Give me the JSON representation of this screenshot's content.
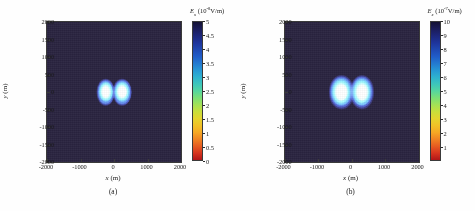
{
  "figure": {
    "panels": [
      {
        "caption": "(a)",
        "xlabel_sym": "x",
        "xlabel_unit": "(m)",
        "ylabel_sym": "y",
        "ylabel_unit": "(m)",
        "colorbar_sym": "E",
        "colorbar_sub": "x",
        "colorbar_unit": "(10",
        "colorbar_exp": "-8",
        "colorbar_unit2": "V/m)"
      },
      {
        "caption": "(b)",
        "xlabel_sym": "x",
        "xlabel_unit": "(m)",
        "ylabel_sym": "y",
        "ylabel_unit": "(m)",
        "colorbar_sym": "E",
        "colorbar_sub": "x",
        "colorbar_unit": "(10",
        "colorbar_exp": "-7",
        "colorbar_unit2": "V/m)"
      }
    ]
  },
  "chart_data": [
    {
      "type": "heatmap",
      "title": "",
      "panel": "(a)",
      "xlabel": "x (m)",
      "ylabel": "y (m)",
      "xlim": [
        -2000,
        2000
      ],
      "ylim": [
        -2000,
        2000
      ],
      "xticks": [
        -2000,
        -1000,
        0,
        1000,
        2000
      ],
      "xticklabels": [
        "-2000",
        "-1000",
        "0",
        "1000",
        "2000"
      ],
      "yticks": [
        2000,
        1500,
        1000,
        500,
        0,
        -500,
        -1000,
        -1500,
        -2000
      ],
      "yticklabels": [
        "2000",
        "1500",
        "1000",
        "500",
        "0",
        "-500",
        "-1000",
        "-1500",
        "-2000"
      ],
      "grid": false,
      "colormap": "jet",
      "colorbar": {
        "label": "E_x (10^-8 V/m)",
        "min": 0,
        "max": 5,
        "ticks": [
          5,
          4.5,
          4,
          3.5,
          3,
          2.5,
          2,
          1.5,
          1,
          0.5,
          0
        ],
        "ticklabels": [
          "5",
          "4.5",
          "4",
          "3.5",
          "3",
          "2.5",
          "2",
          "1.5",
          "1",
          "0.5",
          "0"
        ]
      },
      "features": [
        {
          "name": "left-lobe",
          "center_x": -250,
          "center_y": 0,
          "peak_value": 5,
          "radius_x": 280,
          "radius_y": 380
        },
        {
          "name": "right-lobe",
          "center_x": 250,
          "center_y": 0,
          "peak_value": 5,
          "radius_x": 280,
          "radius_y": 380
        }
      ],
      "background_value": 0
    },
    {
      "type": "heatmap",
      "title": "",
      "panel": "(b)",
      "xlabel": "x (m)",
      "ylabel": "y (m)",
      "xlim": [
        -2000,
        2000
      ],
      "ylim": [
        -2000,
        2000
      ],
      "xticks": [
        -2000,
        -1000,
        0,
        1000,
        2000
      ],
      "xticklabels": [
        "-2000",
        "-1000",
        "0",
        "1000",
        "2000"
      ],
      "yticks": [
        2000,
        1500,
        1000,
        500,
        0,
        -500,
        -1000,
        -1500,
        -2000
      ],
      "yticklabels": [
        "2000",
        "1500",
        "1000",
        "500",
        "0",
        "-500",
        "-1000",
        "-1500",
        "-2000"
      ],
      "grid": false,
      "colormap": "jet",
      "colorbar": {
        "label": "E_x (10^-7 V/m)",
        "min": 0,
        "max": 10,
        "ticks": [
          10,
          9,
          8,
          7,
          6,
          5,
          4,
          3,
          2,
          1
        ],
        "ticklabels": [
          "10",
          "9",
          "8",
          "7",
          "6",
          "5",
          "4",
          "3",
          "2",
          "1"
        ]
      },
      "features": [
        {
          "name": "left-lobe",
          "center_x": -300,
          "center_y": 0,
          "peak_value": 10,
          "radius_x": 360,
          "radius_y": 480
        },
        {
          "name": "right-lobe",
          "center_x": 300,
          "center_y": 0,
          "peak_value": 10,
          "radius_x": 360,
          "radius_y": 480
        }
      ],
      "background_value": 0
    }
  ]
}
